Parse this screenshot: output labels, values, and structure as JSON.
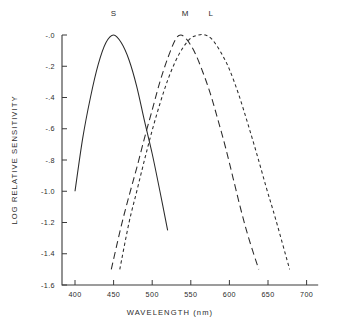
{
  "chart_data": {
    "type": "line",
    "title": "",
    "xlabel": "WAVELENGTH (nm)",
    "ylabel": "LOG RELATIVE SENSITIVITY",
    "xlim": [
      385,
      715
    ],
    "ylim": [
      -1.6,
      0.0
    ],
    "grid": false,
    "legend_position": "inline-above-peaks",
    "xticks": [
      400,
      450,
      500,
      550,
      600,
      650,
      700
    ],
    "xtick_labels": [
      "400",
      "450",
      "500",
      "550",
      "600",
      "650",
      "700"
    ],
    "yticks": [
      0.0,
      -0.2,
      -0.4,
      -0.6,
      -0.8,
      -1.0,
      -1.2,
      -1.4,
      -1.6
    ],
    "ytick_labels": [
      "-.0",
      "-.2",
      "-.4",
      "-.6",
      "-.8",
      "-1.0",
      "-1.2",
      "-1.4",
      "-1.6"
    ],
    "annotations": [
      {
        "text": "S",
        "x": 450,
        "y": 0.12
      },
      {
        "text": "M",
        "x": 543,
        "y": 0.12
      },
      {
        "text": "L",
        "x": 576,
        "y": 0.12
      }
    ],
    "series": [
      {
        "name": "S",
        "label": "S",
        "linestyle": "solid",
        "color": "#2a2a2a",
        "peak_nm": 450,
        "x": [
          400,
          410,
          420,
          430,
          440,
          450,
          460,
          470,
          480,
          490,
          500,
          510,
          520
        ],
        "y": [
          -1.0,
          -0.66,
          -0.4,
          -0.19,
          -0.05,
          -0.0,
          -0.05,
          -0.16,
          -0.33,
          -0.55,
          -0.76,
          -1.0,
          -1.25
        ]
      },
      {
        "name": "M",
        "label": "M",
        "linestyle": "long-dash",
        "color": "#2a2a2a",
        "peak_nm": 537,
        "x": [
          447,
          460,
          470,
          480,
          490,
          500,
          510,
          520,
          530,
          537,
          545,
          555,
          565,
          575,
          585,
          595,
          605,
          615,
          625,
          638
        ],
        "y": [
          -1.5,
          -1.22,
          -1.03,
          -0.85,
          -0.66,
          -0.48,
          -0.3,
          -0.15,
          -0.03,
          -0.0,
          -0.03,
          -0.11,
          -0.23,
          -0.37,
          -0.54,
          -0.72,
          -0.92,
          -1.12,
          -1.3,
          -1.5
        ]
      },
      {
        "name": "L",
        "label": "L",
        "linestyle": "short-dash",
        "color": "#2a2a2a",
        "peak_nm": 569,
        "x": [
          458,
          470,
          480,
          490,
          500,
          510,
          520,
          530,
          540,
          550,
          560,
          569,
          578,
          590,
          600,
          612,
          624,
          636,
          648,
          660,
          678
        ],
        "y": [
          -1.5,
          -1.2,
          -1.0,
          -0.8,
          -0.61,
          -0.44,
          -0.29,
          -0.17,
          -0.08,
          -0.02,
          -0.0,
          -0.0,
          -0.03,
          -0.12,
          -0.22,
          -0.38,
          -0.57,
          -0.77,
          -0.98,
          -1.18,
          -1.5
        ]
      }
    ]
  },
  "axes": {
    "x_axis_label": "WAVELENGTH (nm)",
    "y_axis_label": "LOG RELATIVE SENSITIVITY"
  }
}
